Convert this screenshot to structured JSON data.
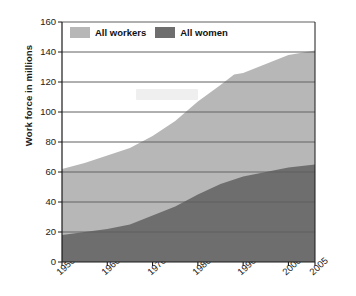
{
  "chart_data": {
    "type": "area",
    "title": "",
    "xlabel": "",
    "ylabel": "Work force in millions",
    "ylim": [
      0,
      160
    ],
    "ytick_labels": [
      "160",
      "140",
      "120",
      "100",
      "80",
      "60",
      "40",
      "20",
      "0"
    ],
    "yticks": [
      160,
      140,
      120,
      100,
      80,
      60,
      40,
      20,
      0
    ],
    "xtick_labels": [
      "1950",
      "1960",
      "1970",
      "1980",
      "1990",
      "2000",
      "2005"
    ],
    "x": [
      1950,
      1955,
      1960,
      1965,
      1970,
      1975,
      1980,
      1985,
      1988,
      1990,
      1995,
      2000,
      2005
    ],
    "grid": true,
    "legend_position": "top-left-inside",
    "stacked": true,
    "series": [
      {
        "name": "All workers",
        "color": "#b7b7b7",
        "values": [
          62,
          66,
          71,
          76,
          84,
          94,
          107,
          118,
          125,
          126,
          132,
          138,
          141
        ]
      },
      {
        "name": "All women",
        "color": "#6e6e6e",
        "values": [
          18,
          20,
          22,
          25,
          31,
          37,
          45,
          52,
          55,
          57,
          60,
          63,
          65
        ]
      }
    ]
  },
  "legend": {
    "items": [
      {
        "label": "All workers",
        "color": "#b7b7b7"
      },
      {
        "label": "All women",
        "color": "#6e6e6e"
      }
    ]
  },
  "axis": {
    "y_title": "Work force in millions"
  }
}
